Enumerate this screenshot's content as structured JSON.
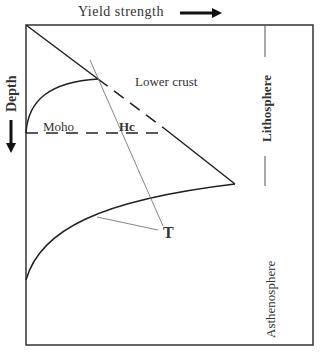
{
  "diagram": {
    "x_axis_label": "Yield strength",
    "y_axis_label": "Depth",
    "labels": {
      "lower_crust": "Lower crust",
      "moho": "Moho",
      "hc": "Hc",
      "t": "T",
      "lithosphere": "Lithosphere",
      "asthenosphere": "Asthenosphere"
    },
    "colors": {
      "line": "#222222",
      "leader": "#777777",
      "background": "#ffffff"
    }
  }
}
